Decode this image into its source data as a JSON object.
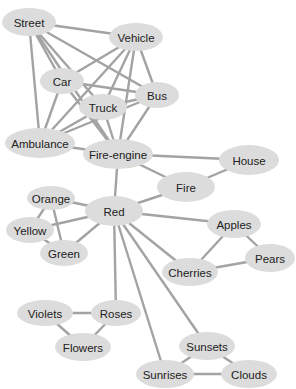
{
  "diagram": {
    "type": "semantic-network",
    "colors": {
      "node_fill": "#dcdcdc",
      "edge": "#a3a3a3",
      "text": "#222222",
      "background": "#ffffff"
    },
    "nodes": [
      {
        "id": "street",
        "label": "Street",
        "x": 29,
        "y": 22,
        "rx": 27,
        "ry": 14
      },
      {
        "id": "vehicle",
        "label": "Vehicle",
        "x": 136,
        "y": 37,
        "rx": 27,
        "ry": 14
      },
      {
        "id": "car",
        "label": "Car",
        "x": 62,
        "y": 81,
        "rx": 22,
        "ry": 13
      },
      {
        "id": "bus",
        "label": "Bus",
        "x": 157,
        "y": 95,
        "rx": 22,
        "ry": 13
      },
      {
        "id": "truck",
        "label": "Truck",
        "x": 103,
        "y": 107,
        "rx": 24,
        "ry": 13
      },
      {
        "id": "ambulance",
        "label": "Ambulance",
        "x": 40,
        "y": 143,
        "rx": 35,
        "ry": 15
      },
      {
        "id": "fire-engine",
        "label": "Fire-engine",
        "x": 118,
        "y": 154,
        "rx": 35,
        "ry": 15
      },
      {
        "id": "house",
        "label": "House",
        "x": 249,
        "y": 160,
        "rx": 30,
        "ry": 15
      },
      {
        "id": "fire",
        "label": "Fire",
        "x": 186,
        "y": 187,
        "rx": 29,
        "ry": 15
      },
      {
        "id": "orange",
        "label": "Orange",
        "x": 51,
        "y": 198,
        "rx": 24,
        "ry": 12
      },
      {
        "id": "red",
        "label": "Red",
        "x": 114,
        "y": 211,
        "rx": 29,
        "ry": 15
      },
      {
        "id": "yellow",
        "label": "Yellow",
        "x": 30,
        "y": 230,
        "rx": 24,
        "ry": 13
      },
      {
        "id": "apples",
        "label": "Apples",
        "x": 234,
        "y": 224,
        "rx": 27,
        "ry": 14
      },
      {
        "id": "green",
        "label": "Green",
        "x": 64,
        "y": 253,
        "rx": 24,
        "ry": 13
      },
      {
        "id": "pears",
        "label": "Pears",
        "x": 270,
        "y": 258,
        "rx": 25,
        "ry": 14
      },
      {
        "id": "cherries",
        "label": "Cherries",
        "x": 190,
        "y": 272,
        "rx": 28,
        "ry": 14
      },
      {
        "id": "violets",
        "label": "Violets",
        "x": 45,
        "y": 313,
        "rx": 28,
        "ry": 13
      },
      {
        "id": "roses",
        "label": "Roses",
        "x": 116,
        "y": 313,
        "rx": 25,
        "ry": 13
      },
      {
        "id": "flowers",
        "label": "Flowers",
        "x": 83,
        "y": 347,
        "rx": 28,
        "ry": 14
      },
      {
        "id": "sunsets",
        "label": "Sunsets",
        "x": 207,
        "y": 346,
        "rx": 28,
        "ry": 14
      },
      {
        "id": "sunrises",
        "label": "Sunrises",
        "x": 165,
        "y": 374,
        "rx": 29,
        "ry": 14
      },
      {
        "id": "clouds",
        "label": "Clouds",
        "x": 249,
        "y": 374,
        "rx": 28,
        "ry": 14
      }
    ],
    "edges": [
      [
        "street",
        "vehicle"
      ],
      [
        "street",
        "car"
      ],
      [
        "street",
        "bus"
      ],
      [
        "street",
        "truck"
      ],
      [
        "street",
        "ambulance"
      ],
      [
        "street",
        "fire-engine"
      ],
      [
        "vehicle",
        "car"
      ],
      [
        "vehicle",
        "bus"
      ],
      [
        "vehicle",
        "truck"
      ],
      [
        "vehicle",
        "ambulance"
      ],
      [
        "vehicle",
        "fire-engine"
      ],
      [
        "car",
        "bus"
      ],
      [
        "car",
        "ambulance"
      ],
      [
        "car",
        "fire-engine"
      ],
      [
        "truck",
        "bus"
      ],
      [
        "truck",
        "ambulance"
      ],
      [
        "truck",
        "fire-engine"
      ],
      [
        "bus",
        "ambulance"
      ],
      [
        "bus",
        "fire-engine"
      ],
      [
        "ambulance",
        "fire-engine"
      ],
      [
        "fire-engine",
        "house"
      ],
      [
        "fire-engine",
        "fire"
      ],
      [
        "fire-engine",
        "red"
      ],
      [
        "house",
        "fire"
      ],
      [
        "fire",
        "red"
      ],
      [
        "red",
        "orange"
      ],
      [
        "red",
        "yellow"
      ],
      [
        "red",
        "green"
      ],
      [
        "orange",
        "yellow"
      ],
      [
        "orange",
        "green"
      ],
      [
        "yellow",
        "green"
      ],
      [
        "red",
        "apples"
      ],
      [
        "red",
        "cherries"
      ],
      [
        "red",
        "roses"
      ],
      [
        "red",
        "sunrises"
      ],
      [
        "red",
        "sunsets"
      ],
      [
        "apples",
        "pears"
      ],
      [
        "apples",
        "cherries"
      ],
      [
        "cherries",
        "pears"
      ],
      [
        "violets",
        "roses"
      ],
      [
        "violets",
        "flowers"
      ],
      [
        "roses",
        "flowers"
      ],
      [
        "sunsets",
        "sunrises"
      ],
      [
        "sunsets",
        "clouds"
      ],
      [
        "sunrises",
        "clouds"
      ]
    ]
  }
}
